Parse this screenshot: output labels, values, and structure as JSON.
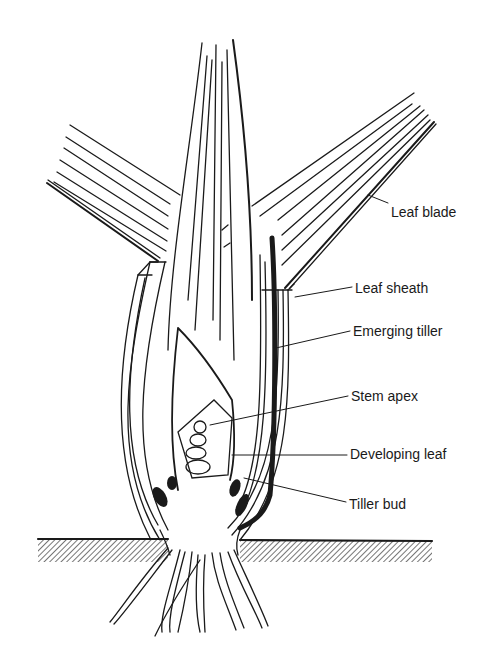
{
  "figure": {
    "ink_color": "#1a1a1a",
    "background": "#ffffff",
    "labels": [
      {
        "id": "leaf-blade",
        "text": "Leaf blade",
        "x": 391,
        "y": 204
      },
      {
        "id": "leaf-sheath",
        "text": "Leaf sheath",
        "x": 355,
        "y": 287
      },
      {
        "id": "emerging-tiller",
        "text": "Emerging tiller",
        "x": 353,
        "y": 325
      },
      {
        "id": "stem-apex",
        "text": "Stem apex",
        "x": 351,
        "y": 389
      },
      {
        "id": "developing-leaf",
        "text": "Developing leaf",
        "x": 350,
        "y": 446
      },
      {
        "id": "tiller-bud",
        "text": "Tiller bud",
        "x": 349,
        "y": 496
      }
    ]
  }
}
